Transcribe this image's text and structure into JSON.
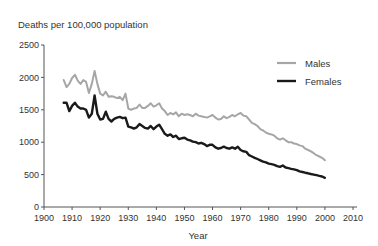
{
  "chart_data": {
    "type": "line",
    "title": "",
    "ylabel": "Deaths per 100,000 population",
    "xlabel": "Year",
    "xlim": [
      1900,
      2010
    ],
    "ylim": [
      0,
      2500
    ],
    "x_ticks": [
      1900,
      1910,
      1920,
      1930,
      1940,
      1950,
      1960,
      1970,
      1980,
      1990,
      2000,
      2010
    ],
    "y_ticks": [
      0,
      500,
      1000,
      1500,
      2000,
      2500
    ],
    "grid": false,
    "legend_position": "upper right",
    "series": [
      {
        "name": "Males",
        "color": "#a6a6a6",
        "x": [
          1907,
          1908,
          1909,
          1910,
          1911,
          1912,
          1913,
          1914,
          1915,
          1916,
          1917,
          1918,
          1919,
          1920,
          1921,
          1922,
          1923,
          1924,
          1925,
          1926,
          1927,
          1928,
          1929,
          1930,
          1931,
          1932,
          1933,
          1934,
          1935,
          1936,
          1937,
          1938,
          1939,
          1940,
          1941,
          1942,
          1943,
          1944,
          1945,
          1946,
          1947,
          1948,
          1949,
          1950,
          1951,
          1952,
          1953,
          1954,
          1955,
          1956,
          1957,
          1958,
          1959,
          1960,
          1961,
          1962,
          1963,
          1964,
          1965,
          1966,
          1967,
          1968,
          1969,
          1970,
          1971,
          1972,
          1973,
          1974,
          1975,
          1976,
          1977,
          1978,
          1979,
          1980,
          1981,
          1982,
          1983,
          1984,
          1985,
          1986,
          1987,
          1988,
          1989,
          1990,
          1991,
          1992,
          1993,
          1994,
          1995,
          1996,
          1997,
          1998,
          1999,
          2000
        ],
        "values": [
          1960,
          1850,
          1900,
          1990,
          2040,
          1950,
          1900,
          1960,
          1930,
          1760,
          1900,
          2100,
          1900,
          1750,
          1720,
          1780,
          1700,
          1710,
          1700,
          1680,
          1700,
          1650,
          1750,
          1520,
          1500,
          1520,
          1530,
          1580,
          1530,
          1530,
          1560,
          1600,
          1550,
          1570,
          1600,
          1520,
          1480,
          1420,
          1450,
          1430,
          1460,
          1400,
          1440,
          1420,
          1430,
          1420,
          1400,
          1440,
          1410,
          1400,
          1390,
          1380,
          1400,
          1420,
          1380,
          1350,
          1360,
          1400,
          1370,
          1390,
          1420,
          1400,
          1430,
          1450,
          1410,
          1400,
          1350,
          1300,
          1280,
          1250,
          1200,
          1180,
          1150,
          1130,
          1120,
          1100,
          1060,
          1040,
          1060,
          1030,
          1000,
          1000,
          980,
          970,
          950,
          940,
          900,
          880,
          860,
          830,
          800,
          780,
          760,
          720
        ]
      },
      {
        "name": "Females",
        "color": "#1a1a1a",
        "x": [
          1907,
          1908,
          1909,
          1910,
          1911,
          1912,
          1913,
          1914,
          1915,
          1916,
          1917,
          1918,
          1919,
          1920,
          1921,
          1922,
          1923,
          1924,
          1925,
          1926,
          1927,
          1928,
          1929,
          1930,
          1931,
          1932,
          1933,
          1934,
          1935,
          1936,
          1937,
          1938,
          1939,
          1940,
          1941,
          1942,
          1943,
          1944,
          1945,
          1946,
          1947,
          1948,
          1949,
          1950,
          1951,
          1952,
          1953,
          1954,
          1955,
          1956,
          1957,
          1958,
          1959,
          1960,
          1961,
          1962,
          1963,
          1964,
          1965,
          1966,
          1967,
          1968,
          1969,
          1970,
          1971,
          1972,
          1973,
          1974,
          1975,
          1976,
          1977,
          1978,
          1979,
          1980,
          1981,
          1982,
          1983,
          1984,
          1985,
          1986,
          1987,
          1988,
          1989,
          1990,
          1991,
          1992,
          1993,
          1994,
          1995,
          1996,
          1997,
          1998,
          1999,
          2000
        ],
        "values": [
          1610,
          1610,
          1480,
          1560,
          1610,
          1550,
          1520,
          1520,
          1500,
          1380,
          1440,
          1720,
          1440,
          1350,
          1360,
          1470,
          1360,
          1320,
          1360,
          1380,
          1390,
          1370,
          1380,
          1240,
          1230,
          1210,
          1230,
          1280,
          1250,
          1220,
          1210,
          1250,
          1200,
          1240,
          1270,
          1200,
          1130,
          1100,
          1120,
          1080,
          1100,
          1050,
          1060,
          1070,
          1040,
          1030,
          1010,
          1000,
          980,
          990,
          970,
          940,
          960,
          960,
          920,
          900,
          910,
          930,
          910,
          900,
          920,
          900,
          930,
          880,
          860,
          850,
          800,
          780,
          760,
          740,
          720,
          700,
          690,
          670,
          660,
          650,
          630,
          620,
          640,
          610,
          600,
          590,
          580,
          570,
          550,
          540,
          530,
          520,
          510,
          500,
          490,
          480,
          470,
          450
        ]
      }
    ]
  },
  "legend": {
    "males_label": "Males",
    "females_label": "Females"
  },
  "axes": {
    "y_title": "Deaths per 100,000 population",
    "x_title": "Year"
  }
}
